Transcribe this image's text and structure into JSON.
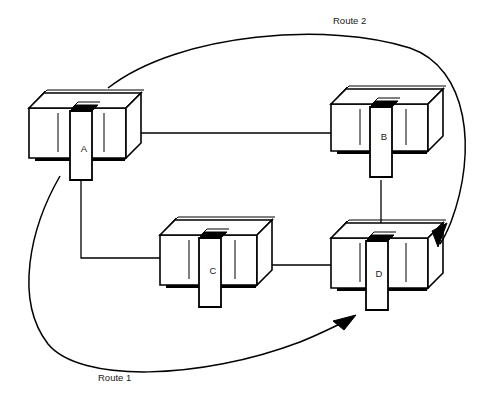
{
  "diagram": {
    "background_color": "#ffffff",
    "line_color": "#000000",
    "width": 494,
    "height": 415,
    "nodes": [
      {
        "id": "A",
        "label": "A",
        "label_x": 84,
        "label_y": 152,
        "x": 26,
        "y": 88
      },
      {
        "id": "B",
        "label": "B",
        "label_x": 384,
        "label_y": 140,
        "x": 330,
        "y": 84
      },
      {
        "id": "C",
        "label": "C",
        "label_x": 213,
        "label_y": 274,
        "x": 157,
        "y": 214
      },
      {
        "id": "D",
        "label": "D",
        "label_x": 379,
        "label_y": 277,
        "x": 330,
        "y": 222
      }
    ],
    "links": [
      {
        "from": "A",
        "to": "B",
        "kind": "horizontal"
      },
      {
        "from": "A",
        "to": "C",
        "kind": "elbow"
      },
      {
        "from": "B",
        "to": "D",
        "kind": "vertical"
      },
      {
        "from": "C",
        "to": "D",
        "kind": "horizontal"
      }
    ],
    "routes": [
      {
        "id": "route2",
        "label": "Route 2",
        "label_x": 333,
        "label_y": 24,
        "from": "A",
        "to": "D",
        "direction": "clockwise-over-top"
      },
      {
        "id": "route1",
        "label": "Route 1",
        "label_x": 98,
        "label_y": 381,
        "from": "A",
        "to": "D",
        "direction": "counterclockwise-under-bottom"
      }
    ]
  }
}
